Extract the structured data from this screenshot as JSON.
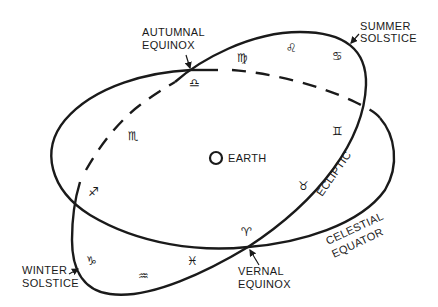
{
  "diagram": {
    "type": "celestial sphere — ecliptic and celestial equator",
    "center": {
      "label": "EARTH"
    },
    "curves": [
      {
        "name": "Ecliptic",
        "label": "ECLIPTIC"
      },
      {
        "name": "Celestial Equator",
        "label_line1": "CELESTIAL",
        "label_line2": "EQUATOR"
      }
    ],
    "points": {
      "autumnal_equinox": {
        "line1": "AUTUMNAL",
        "line2": "EQUINOX"
      },
      "summer_solstice": {
        "line1": "SUMMER",
        "line2": "SOLSTICE"
      },
      "vernal_equinox": {
        "line1": "VERNAL",
        "line2": "EQUINOX"
      },
      "winter_solstice": {
        "line1": "WINTER",
        "line2": "SOLSTICE"
      }
    },
    "zodiac": [
      {
        "name": "Libra",
        "glyph": "♎"
      },
      {
        "name": "Virgo",
        "glyph": "♍"
      },
      {
        "name": "Leo",
        "glyph": "♌"
      },
      {
        "name": "Cancer",
        "glyph": "♋"
      },
      {
        "name": "Gemini",
        "glyph": "♊"
      },
      {
        "name": "Taurus",
        "glyph": "♉"
      },
      {
        "name": "Aries",
        "glyph": "♈"
      },
      {
        "name": "Pisces",
        "glyph": "♓"
      },
      {
        "name": "Aquarius",
        "glyph": "♒"
      },
      {
        "name": "Capricorn",
        "glyph": "♑"
      },
      {
        "name": "Sagittarius",
        "glyph": "♐"
      },
      {
        "name": "Scorpio",
        "glyph": "♏"
      }
    ],
    "colors": {
      "ink": "#1a1a1a",
      "background": "#ffffff"
    }
  }
}
